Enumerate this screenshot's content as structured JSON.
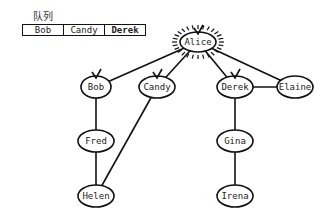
{
  "queue": {
    "label": "队列",
    "items": [
      "Bob",
      "Candy",
      "Derek"
    ],
    "highlighted_item": "Derek"
  },
  "graph": {
    "nodes": [
      {
        "id": "alice",
        "label": "Alice",
        "x": 198,
        "y": 42,
        "rx": 18,
        "ry": 10,
        "state": "current"
      },
      {
        "id": "bob",
        "label": "Bob",
        "x": 96,
        "y": 87,
        "rx": 15,
        "ry": 11,
        "state": "visited"
      },
      {
        "id": "candy",
        "label": "Candy",
        "x": 157,
        "y": 87,
        "rx": 18,
        "ry": 11,
        "state": "visited"
      },
      {
        "id": "derek",
        "label": "Derek",
        "x": 235,
        "y": 87,
        "rx": 18,
        "ry": 11,
        "state": "visited"
      },
      {
        "id": "elaine",
        "label": "Elaine",
        "x": 295,
        "y": 87,
        "rx": 18,
        "ry": 11,
        "state": "unvisited"
      },
      {
        "id": "fred",
        "label": "Fred",
        "x": 96,
        "y": 141,
        "rx": 18,
        "ry": 11,
        "state": "unvisited"
      },
      {
        "id": "gina",
        "label": "Gina",
        "x": 235,
        "y": 141,
        "rx": 18,
        "ry": 11,
        "state": "unvisited"
      },
      {
        "id": "helen",
        "label": "Helen",
        "x": 96,
        "y": 196,
        "rx": 18,
        "ry": 11,
        "state": "unvisited"
      },
      {
        "id": "irena",
        "label": "Irena",
        "x": 235,
        "y": 196,
        "rx": 18,
        "ry": 11,
        "state": "unvisited"
      }
    ],
    "edges": [
      [
        "alice",
        "bob"
      ],
      [
        "alice",
        "candy"
      ],
      [
        "alice",
        "derek"
      ],
      [
        "alice",
        "elaine"
      ],
      [
        "bob",
        "fred"
      ],
      [
        "fred",
        "helen"
      ],
      [
        "candy",
        "helen"
      ],
      [
        "derek",
        "elaine"
      ],
      [
        "derek",
        "gina"
      ],
      [
        "gina",
        "irena"
      ]
    ],
    "colors": {
      "stroke": "#111111",
      "fill": "#ffffff",
      "text": "#222222"
    }
  }
}
